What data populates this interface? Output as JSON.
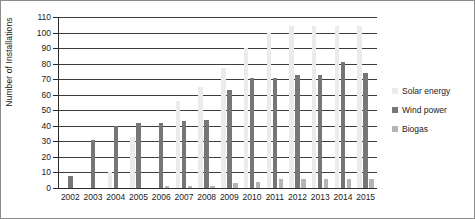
{
  "chart_data": {
    "type": "bar",
    "title": "",
    "xlabel": "",
    "ylabel": "Number of Installations",
    "ylim": [
      0,
      110
    ],
    "ytick_step": 10,
    "yticks": [
      110,
      100,
      90,
      80,
      70,
      60,
      50,
      40,
      30,
      20,
      10,
      0
    ],
    "grid": true,
    "legend_position": "right",
    "categories": [
      "2002",
      "2003",
      "2004",
      "2005",
      "2006",
      "2007",
      "2008",
      "2009",
      "2010",
      "2011",
      "2012",
      "2013",
      "2014",
      "2015"
    ],
    "series": [
      {
        "name": "Solar energy",
        "color": "#ebebeb",
        "values": [
          0,
          0,
          10,
          33,
          0,
          56,
          65,
          77,
          90,
          100,
          104,
          104,
          104,
          104
        ]
      },
      {
        "name": "Wind power",
        "color": "#767676",
        "values": [
          8,
          31,
          40,
          42,
          42,
          43,
          44,
          63,
          71,
          71,
          73,
          73,
          81,
          74
        ]
      },
      {
        "name": "Biogas",
        "color": "#b5b5b5",
        "values": [
          0,
          0,
          0,
          0,
          1,
          1,
          1,
          3,
          4,
          6,
          6,
          6,
          6,
          6
        ]
      }
    ]
  },
  "legend": {
    "items": [
      {
        "label": "Solar energy"
      },
      {
        "label": "Wind power"
      },
      {
        "label": "Biogas"
      }
    ]
  }
}
